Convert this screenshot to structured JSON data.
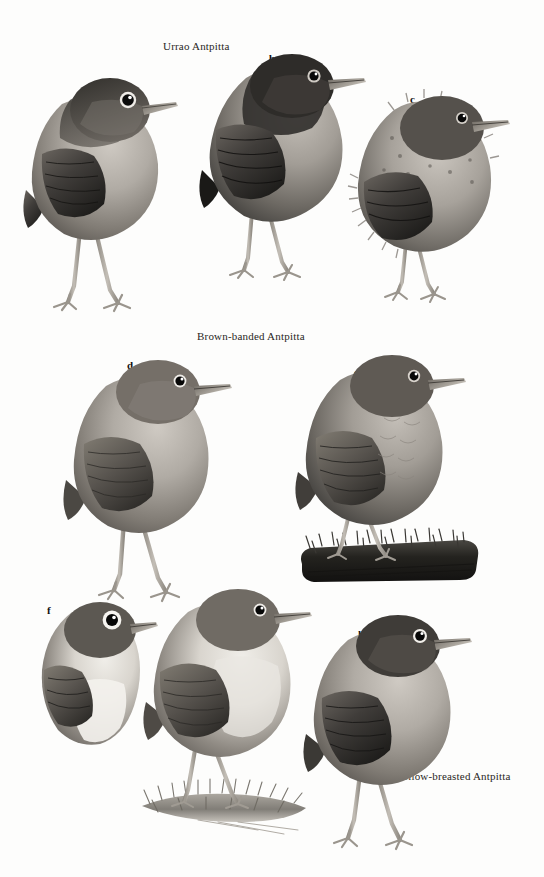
{
  "plate": {
    "title_captions": [
      {
        "text": "Urrao Antpitta",
        "x": 163,
        "y": 40
      },
      {
        "text": "Brown-banded Antpitta",
        "x": 197,
        "y": 330
      },
      {
        "text": "Yellow-breasted Antpitta",
        "x": 396,
        "y": 770
      }
    ],
    "figures": [
      {
        "letter": "a",
        "x": 86,
        "y": 86,
        "species": "Urrao Antpitta",
        "pose": "standing adult, side view facing right",
        "upperparts": "#6e6a66",
        "underparts": "#b9b4ad",
        "perch": false
      },
      {
        "letter": "b",
        "x": 269,
        "y": 52,
        "species": "Urrao Antpitta",
        "pose": "standing adult, darker crown, facing right",
        "upperparts": "#4a4845",
        "underparts": "#a9a49d",
        "perch": false
      },
      {
        "letter": "c",
        "x": 410,
        "y": 93,
        "species": "Urrao Antpitta",
        "pose": "fluffy juvenile, facing right",
        "upperparts": "#5d5a56",
        "underparts": "#b5b0a9",
        "perch": false
      },
      {
        "letter": "d",
        "x": 127,
        "y": 359,
        "species": "Brown-banded Antpitta",
        "pose": "standing adult, plain grey-brown, facing right",
        "upperparts": "#7b766f",
        "underparts": "#a8a39b",
        "perch": false
      },
      {
        "letter": "e",
        "x": 354,
        "y": 366,
        "species": "Brown-banded Antpitta",
        "pose": "adult standing on dark mossy log, facing right",
        "upperparts": "#6f6b65",
        "underparts": "#a5a098",
        "perch": true
      },
      {
        "letter": "f",
        "x": 47,
        "y": 604,
        "species": "Yellow-breasted Antpitta",
        "pose": "partial front-quarter view, white eye-ring, white belly",
        "upperparts": "#6d6963",
        "underparts": "#eceae5",
        "perch": false
      },
      {
        "letter": "g",
        "x": 208,
        "y": 601,
        "species": "Yellow-breasted Antpitta",
        "pose": "adult standing on grassy ground, pale breast, facing right",
        "upperparts": "#75706a",
        "underparts": "#dedad3",
        "perch": true
      },
      {
        "letter": "h",
        "x": 358,
        "y": 628,
        "species": "Yellow-breasted Antpitta",
        "pose": "adult standing, dark cap, facing right",
        "upperparts": "#5e5a55",
        "underparts": "#c6c2bb",
        "perch": false
      }
    ],
    "colors": {
      "background": "#fdfdfc",
      "ink": "#1a1a1a",
      "dark_plumage": "#3c3a37",
      "mid_plumage": "#6e6a66",
      "light_plumage": "#b9b4ad",
      "bill": "#8d8881",
      "leg": "#b6b1a9",
      "eye": "#0b0b0b",
      "eyering": "#f2f0ec",
      "moss": "#2b2a27"
    }
  }
}
